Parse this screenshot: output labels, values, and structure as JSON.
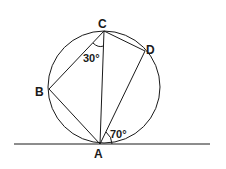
{
  "diagram": {
    "points": {
      "A": {
        "label": "A",
        "x": 100,
        "y": 144
      },
      "B": {
        "label": "B",
        "x": 49,
        "y": 89
      },
      "C": {
        "label": "C",
        "x": 104,
        "y": 31
      },
      "D": {
        "label": "D",
        "x": 145,
        "y": 51
      }
    },
    "circle": {
      "cx": 104,
      "cy": 87,
      "r": 56
    },
    "tangent_line": {
      "x1": 14,
      "y1": 144,
      "x2": 210,
      "y2": 144
    },
    "angles": {
      "angle_BCA": "30°",
      "angle_tangent_AD": "70°"
    },
    "colors": {
      "stroke": "#1a1a1a",
      "background": "#ffffff"
    }
  }
}
